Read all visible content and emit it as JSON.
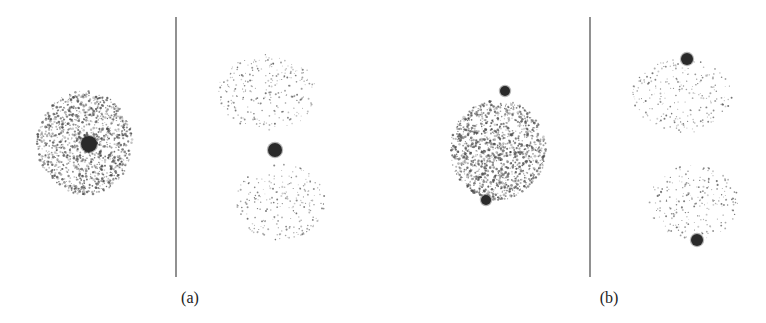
{
  "figure": {
    "panels": [
      {
        "label": "(a)",
        "label_pos": [
          190,
          298
        ],
        "divider": {
          "x": 176,
          "y1": 17,
          "y2": 277
        },
        "left_cluster": {
          "cx": 85,
          "cy": 143,
          "rx": 48,
          "ry": 52,
          "density": "dense",
          "count": 1100
        },
        "left_blobs": [
          {
            "cx": 89,
            "cy": 144,
            "r": 8
          }
        ],
        "right_clusters": [
          {
            "cx": 268,
            "cy": 92,
            "rx": 50,
            "ry": 38,
            "count": 260
          },
          {
            "cx": 280,
            "cy": 202,
            "rx": 45,
            "ry": 38,
            "count": 230
          }
        ],
        "right_blobs": [
          {
            "cx": 275,
            "cy": 150,
            "r": 7
          }
        ]
      },
      {
        "label": "(b)",
        "label_pos": [
          609,
          298
        ],
        "divider": {
          "x": 590,
          "y1": 17,
          "y2": 277
        },
        "left_cluster": {
          "cx": 498,
          "cy": 150,
          "rx": 48,
          "ry": 50,
          "density": "dense",
          "count": 1200
        },
        "left_blobs": [
          {
            "cx": 505,
            "cy": 91,
            "r": 5
          },
          {
            "cx": 486,
            "cy": 200,
            "r": 5
          }
        ],
        "right_clusters": [
          {
            "cx": 682,
            "cy": 95,
            "rx": 50,
            "ry": 38,
            "count": 240
          },
          {
            "cx": 693,
            "cy": 202,
            "rx": 45,
            "ry": 38,
            "count": 220
          }
        ],
        "right_blobs": [
          {
            "cx": 687,
            "cy": 59,
            "r": 6
          },
          {
            "cx": 697,
            "cy": 240,
            "r": 6
          }
        ]
      }
    ],
    "colors": {
      "dot": "#444444",
      "blob": "#2a2a2a",
      "divider": "#555555"
    }
  }
}
